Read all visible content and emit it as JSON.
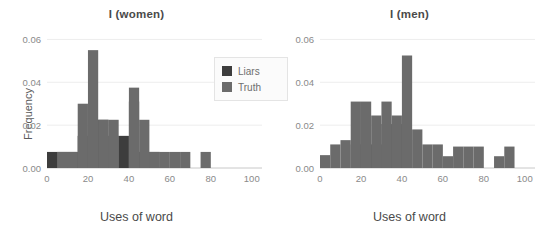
{
  "figure": {
    "background_color": "#ffffff",
    "grid_color": "#ededed",
    "axis_color": "#c8c8c8",
    "tick_label_color": "#8a8a8a",
    "title_color": "#4a4a4a"
  },
  "legend": {
    "position": "center-right-of-left-panel",
    "entries": [
      {
        "label": "Liars",
        "color": "#3d3d3d"
      },
      {
        "label": "Truth",
        "color": "#6b6b6b"
      }
    ]
  },
  "chart_data": [
    {
      "type": "bar",
      "panel": "left",
      "title": "I (women)",
      "xlabel": "Uses of word",
      "ylabel": "Frequency",
      "xlim": [
        0,
        105
      ],
      "ylim": [
        0,
        0.063
      ],
      "xticks": [
        0,
        20,
        40,
        60,
        80,
        100
      ],
      "xticklabels": [
        "0",
        "20",
        "40",
        "60",
        "80",
        "100"
      ],
      "yticks": [
        0.0,
        0.02,
        0.04,
        0.06
      ],
      "yticklabels": [
        "0.00",
        "0.02",
        "0.04",
        "0.06"
      ],
      "grid": true,
      "bin_width": 5,
      "bin_edges": [
        0,
        5,
        10,
        15,
        20,
        25,
        30,
        35,
        40,
        45,
        50,
        55,
        60,
        65,
        70,
        75,
        80
      ],
      "series": [
        {
          "name": "Truth",
          "color": "#6b6b6b",
          "values": [
            0.0,
            0.0075,
            0.0075,
            0.03,
            0.055,
            0.0225,
            0.0225,
            0.0,
            0.0375,
            0.0225,
            0.0075,
            0.0075,
            0.0075,
            0.0075,
            0.0,
            0.0075
          ]
        },
        {
          "name": "Liars",
          "color": "#3d3d3d",
          "values": [
            0.0075,
            0.0075,
            0.0075,
            0.015,
            0.0225,
            0.0225,
            0.015,
            0.015,
            0.031,
            0.0075,
            0.0075,
            0.0,
            0.0,
            0.0,
            0.0,
            0.0
          ]
        }
      ],
      "annotations": [
        "Two overlapping histograms; overlap region rendered darker.",
        "Isolated bar near x = 75."
      ]
    },
    {
      "type": "bar",
      "panel": "right",
      "title": "I (men)",
      "xlabel": "Uses of word",
      "ylabel": "",
      "xlim": [
        0,
        105
      ],
      "ylim": [
        0,
        0.063
      ],
      "xticks": [
        0,
        20,
        40,
        60,
        80,
        100
      ],
      "xticklabels": [
        "0",
        "20",
        "40",
        "60",
        "80",
        "100"
      ],
      "yticks": [
        0.0,
        0.02,
        0.04,
        0.06
      ],
      "yticklabels": [
        "0.00",
        "0.02",
        "0.04",
        "0.06"
      ],
      "grid": true,
      "bin_width": 5,
      "bin_edges": [
        0,
        5,
        10,
        15,
        20,
        25,
        30,
        35,
        40,
        45,
        50,
        55,
        60,
        65,
        70,
        75,
        80,
        85,
        90,
        95
      ],
      "series": [
        {
          "name": "Truth",
          "color": "#6b6b6b",
          "values": [
            0.006,
            0.011,
            0.013,
            0.031,
            0.031,
            0.0245,
            0.031,
            0.0245,
            0.0525,
            0.018,
            0.011,
            0.011,
            0.0055,
            0.01,
            0.01,
            0.01,
            0.0,
            0.0055,
            0.01
          ]
        },
        {
          "name": "Liars",
          "color": "#3d3d3d",
          "values": [
            0.0,
            0.0,
            0.0,
            0.011,
            0.011,
            0.011,
            0.0205,
            0.0205,
            0.013,
            0.0,
            0.0,
            0.0,
            0.0,
            0.0,
            0.0,
            0.0,
            0.0,
            0.0,
            0.0
          ]
        }
      ],
      "annotations": [
        "Two overlapping histograms; overlap region rendered darker.",
        "Tall spike just below x = 40.",
        "Separate pair of bars near x = 85-95."
      ]
    }
  ]
}
